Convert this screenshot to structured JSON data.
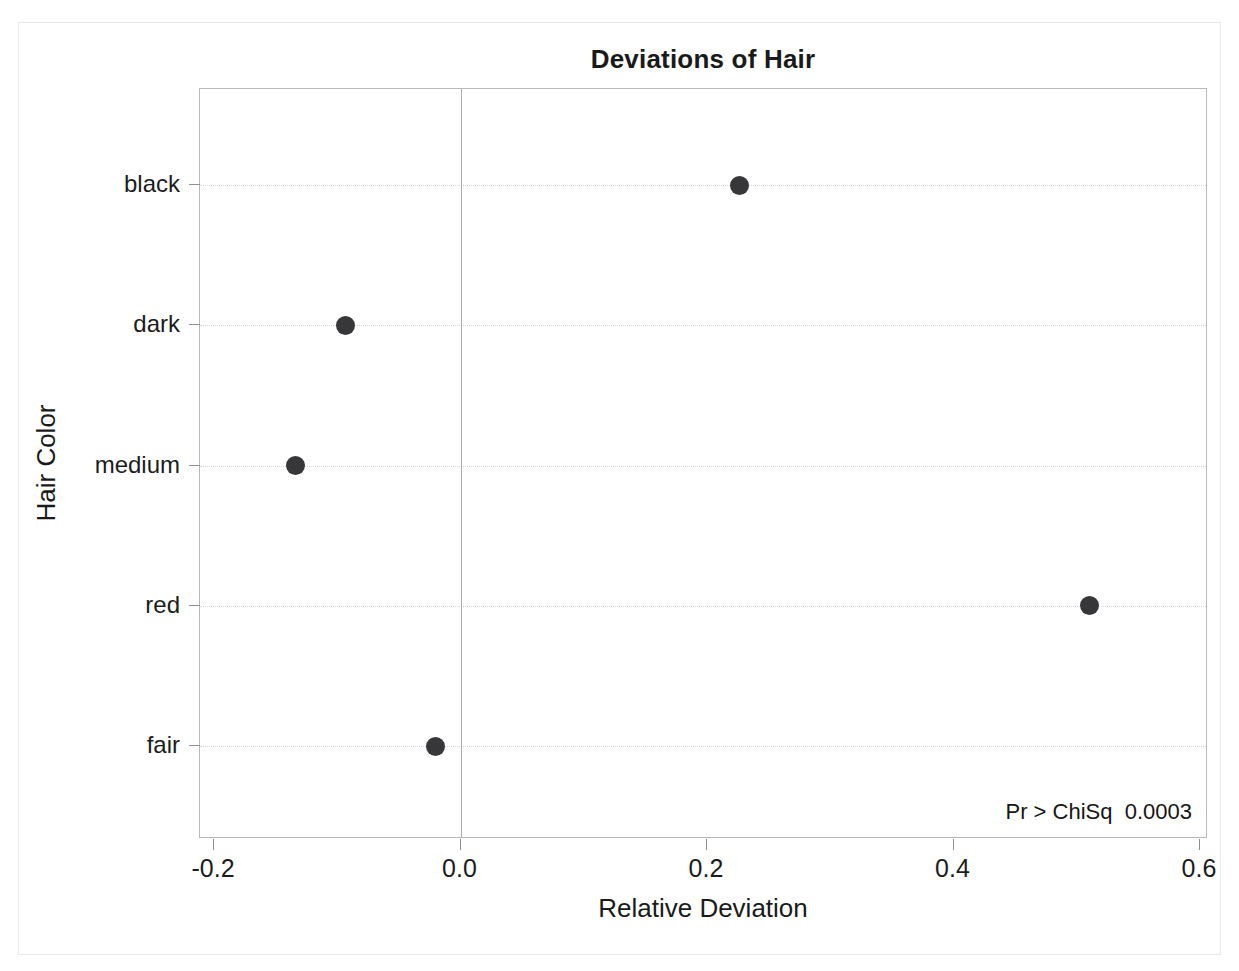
{
  "chart_data": {
    "type": "scatter",
    "title": "Deviations of Hair",
    "xlabel": "Relative Deviation",
    "ylabel": "Hair Color",
    "orientation": "horizontal",
    "categories": [
      "black",
      "dark",
      "medium",
      "red",
      "fair"
    ],
    "values": [
      0.226,
      -0.093,
      -0.134,
      0.51,
      -0.02
    ],
    "series": [
      {
        "name": "Relative Deviation",
        "points": [
          {
            "category": "black",
            "value": 0.226
          },
          {
            "category": "dark",
            "value": -0.093
          },
          {
            "category": "medium",
            "value": -0.134
          },
          {
            "category": "red",
            "value": 0.51
          },
          {
            "category": "fair",
            "value": -0.02
          }
        ]
      }
    ],
    "xlim": [
      -0.2,
      0.6
    ],
    "xticks": [
      -0.2,
      0.0,
      0.2,
      0.4,
      0.6
    ],
    "xtick_labels": [
      "-0.2",
      "0.0",
      "0.2",
      "0.4",
      "0.6"
    ],
    "reference_line_x": 0.0,
    "grid": "horizontal-dotted",
    "legend": "none",
    "marker_color": "#37373a",
    "annotations": [
      {
        "text": "Pr > ChiSq  0.0003",
        "position": "bottom-right-inside-plot",
        "statistic_label": "Pr > ChiSq",
        "statistic_value": "0.0003"
      }
    ]
  },
  "page": {
    "top_clipped_text": "",
    "background_color": "#ffffff",
    "border_color": "#e9e9ec"
  },
  "axes": {
    "x": {
      "title": "Relative Deviation",
      "tick_labels": [
        "-0.2",
        "0.0",
        "0.2",
        "0.4",
        "0.6"
      ]
    },
    "y": {
      "title": "Hair Color",
      "tick_labels": [
        "black",
        "dark",
        "medium",
        "red",
        "fair"
      ]
    }
  },
  "annotation": {
    "label": "Pr > ChiSq",
    "value": "0.0003",
    "full": "Pr > ChiSq  0.0003"
  }
}
